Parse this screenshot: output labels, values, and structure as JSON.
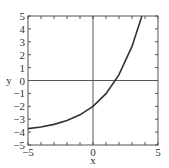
{
  "chart_data": {
    "type": "line",
    "title": "",
    "xlabel": "x",
    "ylabel": "y",
    "xlim": [
      -5,
      5
    ],
    "ylim": [
      -5,
      5
    ],
    "x_ticks": [
      -5,
      0,
      5
    ],
    "x_tick_labels": [
      "−5",
      "0",
      "5"
    ],
    "y_ticks": [
      -5,
      -4,
      -3,
      -2,
      -1,
      0,
      1,
      2,
      3,
      4,
      5
    ],
    "y_tick_labels": [
      "−5",
      "−4",
      "−3",
      "−2",
      "−1",
      "0",
      "1",
      "2",
      "3",
      "4",
      "5"
    ],
    "minor_ticks_every": 1,
    "grid": false,
    "reference_lines": {
      "x": 0,
      "y": 0
    },
    "series": [
      {
        "name": "curve",
        "color": "#333333",
        "description": "increasing exponential, approx y = 2e^(0.4x) - 4",
        "x": [
          -5,
          -4,
          -3,
          -2,
          -1,
          0,
          1,
          1.7,
          2,
          3,
          3.7
        ],
        "y": [
          -3.73,
          -3.6,
          -3.4,
          -3.1,
          -2.66,
          -2.0,
          -1.02,
          0.0,
          0.45,
          2.64,
          4.8
        ]
      }
    ],
    "legend": null
  },
  "colors": {
    "frame": "#555555",
    "curve": "#333333",
    "text": "#333333"
  }
}
